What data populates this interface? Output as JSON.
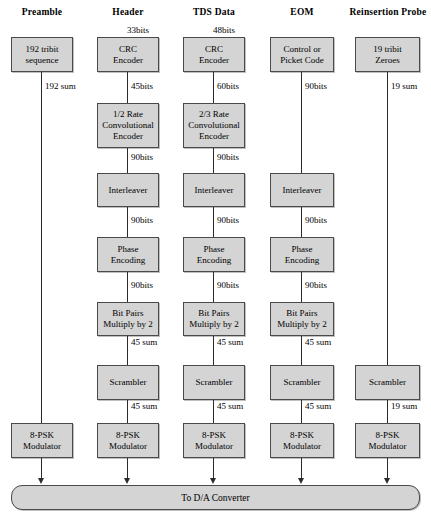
{
  "diagram": {
    "sink": {
      "label": "To D/A Converter"
    },
    "columns": [
      {
        "id": "preamble",
        "title": "Preamble",
        "title_line2": "",
        "nodes": [
          {
            "id": "preamble-source",
            "line1": "192 tribit",
            "line2": "sequence",
            "row": "source"
          },
          {
            "id": "preamble-modulator",
            "line1": "8-PSK",
            "line2": "Modulator",
            "row": "modulator"
          }
        ],
        "edge_labels": [
          {
            "id": "preamble-sum",
            "text": "192 sum"
          }
        ]
      },
      {
        "id": "header",
        "title": "Header",
        "title_line2": "",
        "nodes": [
          {
            "id": "header-crc",
            "line1": "CRC",
            "line2": "Encoder",
            "row": "source"
          },
          {
            "id": "header-conv",
            "line1": "1/2 Rate",
            "line2": "Convolutional",
            "line3": "Encoder",
            "row": "convolutional"
          },
          {
            "id": "header-interleaver",
            "line1": "Interleaver",
            "line2": "",
            "row": "interleaver"
          },
          {
            "id": "header-phase",
            "line1": "Phase",
            "line2": "Encoding",
            "row": "phase"
          },
          {
            "id": "header-bitpairs",
            "line1": "Bit Pairs",
            "line2": "Multiply by 2",
            "row": "bitpairs"
          },
          {
            "id": "header-scrambler",
            "line1": "Scrambler",
            "line2": "",
            "row": "scrambler"
          },
          {
            "id": "header-modulator",
            "line1": "8-PSK",
            "line2": "Modulator",
            "row": "modulator"
          }
        ],
        "edge_labels": [
          {
            "id": "header-in",
            "text": "33bits"
          },
          {
            "id": "header-crc-out",
            "text": "45bits"
          },
          {
            "id": "header-conv-out",
            "text": "90bits"
          },
          {
            "id": "header-interleaver-out",
            "text": "90bits"
          },
          {
            "id": "header-phase-out",
            "text": "90bits"
          },
          {
            "id": "header-bitpairs-out",
            "text": "45 sum"
          },
          {
            "id": "header-scrambler-out",
            "text": "45 sum"
          }
        ]
      },
      {
        "id": "tds",
        "title": "TDS Data",
        "title_line2": "",
        "nodes": [
          {
            "id": "tds-crc",
            "line1": "CRC",
            "line2": "Encoder",
            "row": "source"
          },
          {
            "id": "tds-conv",
            "line1": "2/3 Rate",
            "line2": "Convolutional",
            "line3": "Encoder",
            "row": "convolutional"
          },
          {
            "id": "tds-interleaver",
            "line1": "Interleaver",
            "line2": "",
            "row": "interleaver"
          },
          {
            "id": "tds-phase",
            "line1": "Phase",
            "line2": "Encoding",
            "row": "phase"
          },
          {
            "id": "tds-bitpairs",
            "line1": "Bit Pairs",
            "line2": "Multiply by 2",
            "row": "bitpairs"
          },
          {
            "id": "tds-scrambler",
            "line1": "Scrambler",
            "line2": "",
            "row": "scrambler"
          },
          {
            "id": "tds-modulator",
            "line1": "8-PSK",
            "line2": "Modulator",
            "row": "modulator"
          }
        ],
        "edge_labels": [
          {
            "id": "tds-in",
            "text": "48bits"
          },
          {
            "id": "tds-crc-out",
            "text": "60bits"
          },
          {
            "id": "tds-conv-out",
            "text": "90bits"
          },
          {
            "id": "tds-interleaver-out",
            "text": "90bits"
          },
          {
            "id": "tds-phase-out",
            "text": "90bits"
          },
          {
            "id": "tds-bitpairs-out",
            "text": "45 sum"
          },
          {
            "id": "tds-scrambler-out",
            "text": "45 sum"
          }
        ]
      },
      {
        "id": "eom",
        "title": "EOM",
        "title_line2": "",
        "nodes": [
          {
            "id": "eom-source",
            "line1": "Control or",
            "line2": "Picket Code",
            "row": "source"
          },
          {
            "id": "eom-interleaver",
            "line1": "Interleaver",
            "line2": "",
            "row": "interleaver"
          },
          {
            "id": "eom-phase",
            "line1": "Phase",
            "line2": "Encoding",
            "row": "phase"
          },
          {
            "id": "eom-bitpairs",
            "line1": "Bit Pairs",
            "line2": "Multiply by 2",
            "row": "bitpairs"
          },
          {
            "id": "eom-scrambler",
            "line1": "Scrambler",
            "line2": "",
            "row": "scrambler"
          },
          {
            "id": "eom-modulator",
            "line1": "8-PSK",
            "line2": "Modulator",
            "row": "modulator"
          }
        ],
        "edge_labels": [
          {
            "id": "eom-source-out",
            "text": "90bits"
          },
          {
            "id": "eom-interleaver-out",
            "text": "90bits"
          },
          {
            "id": "eom-phase-out",
            "text": "90bits"
          },
          {
            "id": "eom-bitpairs-out",
            "text": "45 sum"
          },
          {
            "id": "eom-scrambler-out",
            "text": "45 sum"
          }
        ]
      },
      {
        "id": "reinsertion",
        "title": "Reinsertion",
        "title_line2": "Probe",
        "nodes": [
          {
            "id": "reinsertion-source",
            "line1": "19 tribit",
            "line2": "Zeroes",
            "row": "source"
          },
          {
            "id": "reinsertion-scrambler",
            "line1": "Scrambler",
            "line2": "",
            "row": "scrambler"
          },
          {
            "id": "reinsertion-modulator",
            "line1": "8-PSK",
            "line2": "Modulator",
            "row": "modulator"
          }
        ],
        "edge_labels": [
          {
            "id": "reinsertion-source-out",
            "text": "19 sum"
          },
          {
            "id": "reinsertion-scrambler-out",
            "text": "19 sum"
          }
        ]
      }
    ]
  }
}
